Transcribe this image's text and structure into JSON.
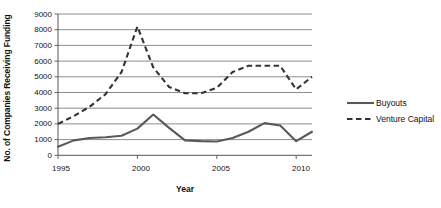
{
  "chart_data": {
    "type": "line",
    "title": "",
    "xlabel": "Year",
    "ylabel": "No. of Companies Receiving Funding",
    "xlim": [
      1995,
      2011
    ],
    "ylim": [
      0,
      9000
    ],
    "ytick_step": 1000,
    "yticks": [
      "0",
      "1000",
      "2000",
      "3000",
      "4000",
      "5000",
      "6000",
      "7000",
      "8000",
      "9000"
    ],
    "xticks": [
      "1995",
      "2000",
      "2005",
      "2010"
    ],
    "grid": "horizontal",
    "legend_position": "right",
    "x": [
      1995,
      1996,
      1997,
      1998,
      1999,
      2000,
      2001,
      2002,
      2003,
      2004,
      2005,
      2006,
      2007,
      2008,
      2009,
      2010,
      2011
    ],
    "series": [
      {
        "name": "Buyouts",
        "style": "solid",
        "color": "#595959",
        "values": [
          550,
          950,
          1100,
          1150,
          1250,
          1700,
          2600,
          1750,
          950,
          900,
          880,
          1100,
          1500,
          2050,
          1900,
          900,
          1500
        ]
      },
      {
        "name": "Venture Capital",
        "style": "dashed",
        "color": "#333333",
        "values": [
          2000,
          2500,
          3100,
          3900,
          5300,
          8200,
          5600,
          4350,
          3950,
          3950,
          4300,
          5300,
          5700,
          5700,
          5700,
          4200,
          5000
        ]
      }
    ]
  },
  "legend": {
    "items": [
      {
        "label": "Buyouts",
        "style": "solid"
      },
      {
        "label": "Venture Capital",
        "style": "dashed"
      }
    ]
  }
}
